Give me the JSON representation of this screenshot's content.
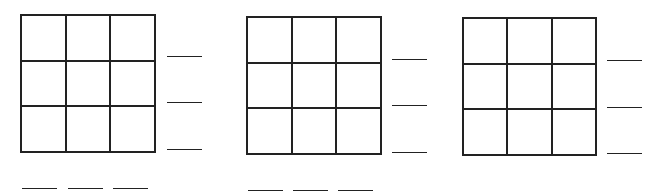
{
  "worksheet": {
    "puzzles": [
      {
        "grid": {
          "rows": 3,
          "cols": 3,
          "cells": [
            "",
            "",
            "",
            "",
            "",
            "",
            "",
            "",
            ""
          ]
        },
        "row_answers": [
          "",
          "",
          ""
        ],
        "col_answers": [
          "",
          "",
          ""
        ]
      },
      {
        "grid": {
          "rows": 3,
          "cols": 3,
          "cells": [
            "",
            "",
            "",
            "",
            "",
            "",
            "",
            "",
            ""
          ]
        },
        "row_answers": [
          "",
          "",
          ""
        ],
        "col_answers": [
          "",
          "",
          ""
        ]
      },
      {
        "grid": {
          "rows": 3,
          "cols": 3,
          "cells": [
            "",
            "",
            "",
            "",
            "",
            "",
            "",
            "",
            ""
          ]
        },
        "row_answers": [
          "",
          "",
          ""
        ],
        "col_answers": []
      }
    ]
  }
}
